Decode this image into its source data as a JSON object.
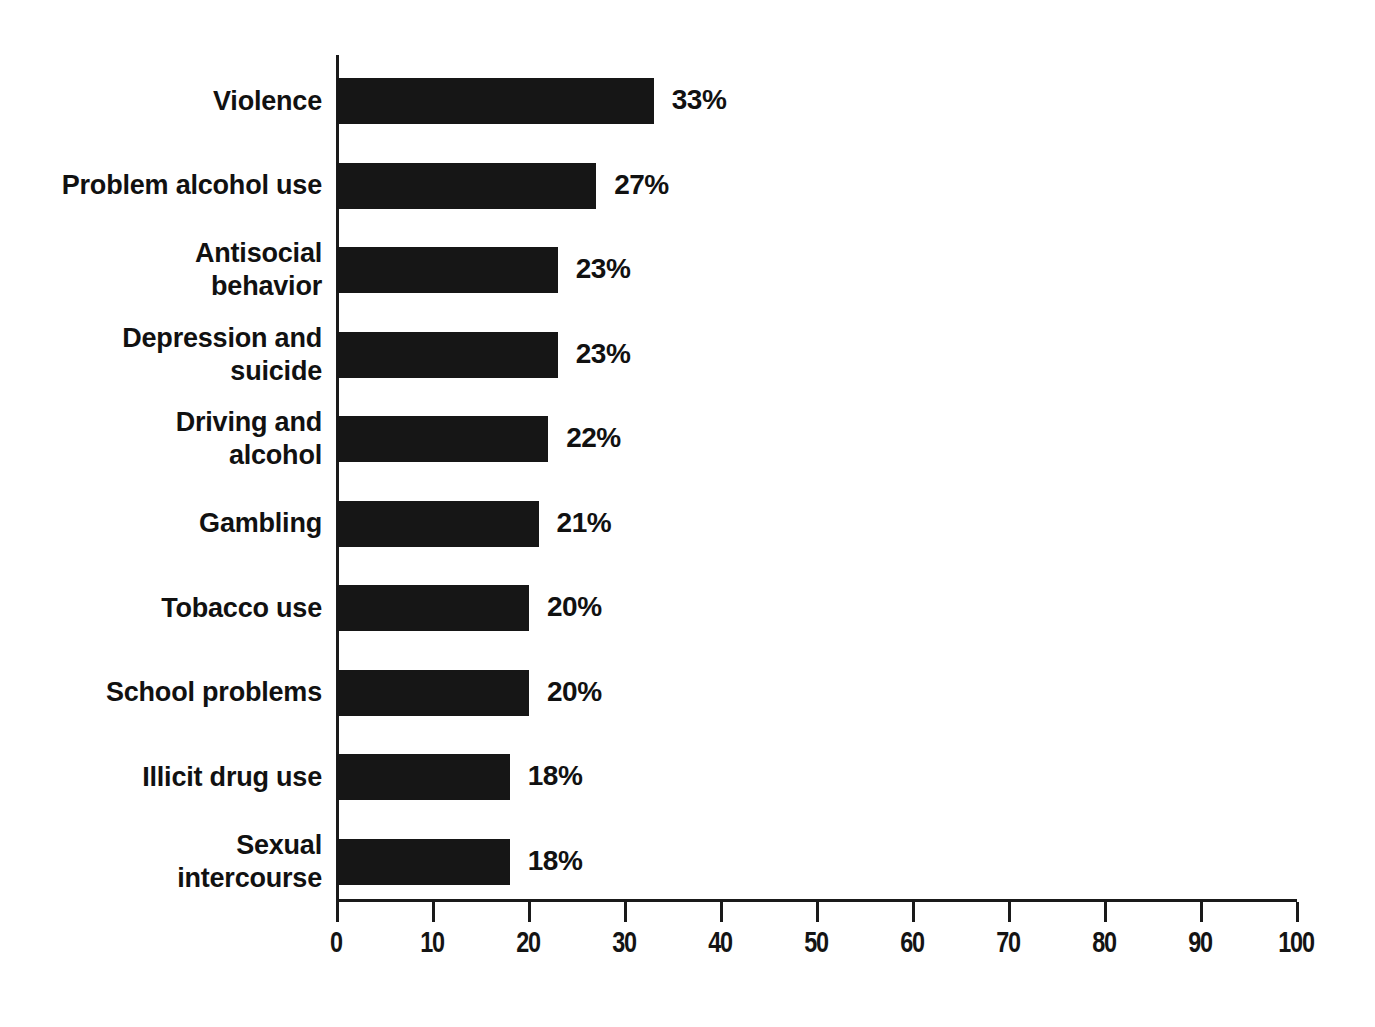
{
  "chart_data": {
    "type": "bar",
    "orientation": "horizontal",
    "title": "",
    "subtitle": "",
    "xlabel": "",
    "ylabel": "",
    "xlim": [
      0,
      100
    ],
    "ylim": null,
    "grid": false,
    "legend": null,
    "bar_color": "#161616",
    "axis_color": "#1a1a1a",
    "background_color": "#ffffff",
    "xticks": [
      0,
      10,
      20,
      30,
      40,
      50,
      60,
      70,
      80,
      90,
      100
    ],
    "xtick_labels": [
      "0",
      "10",
      "20",
      "30",
      "40",
      "50",
      "60",
      "70",
      "80",
      "90",
      "100"
    ],
    "categories": [
      "Violence",
      "Problem alcohol use",
      "Antisocial\nbehavior",
      "Depression and\nsuicide",
      "Driving and\nalcohol",
      "Gambling",
      "Tobacco use",
      "School problems",
      "Illicit drug use",
      "Sexual\nintercourse"
    ],
    "values": [
      33,
      27,
      23,
      23,
      22,
      21,
      20,
      20,
      18,
      18
    ],
    "value_labels": [
      "33%",
      "27%",
      "23%",
      "23%",
      "22%",
      "21%",
      "20%",
      "20%",
      "18%",
      "18%"
    ]
  }
}
